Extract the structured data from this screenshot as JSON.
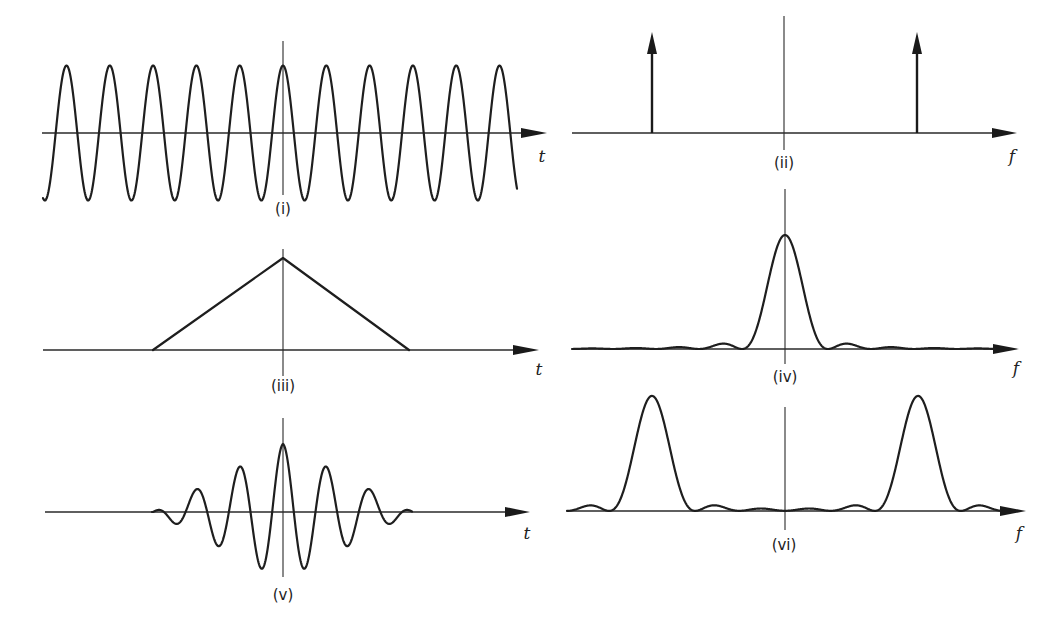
{
  "figure": {
    "panels": [
      {
        "id": "i",
        "label": "(i)",
        "axis_var": "t",
        "domain": "time",
        "description": "Continuous cosine wave"
      },
      {
        "id": "ii",
        "label": "(ii)",
        "axis_var": "f",
        "domain": "frequency",
        "description": "Pair of impulses at ±f0"
      },
      {
        "id": "iii",
        "label": "(iii)",
        "axis_var": "t",
        "domain": "time",
        "description": "Triangular window"
      },
      {
        "id": "iv",
        "label": "(iv)",
        "axis_var": "f",
        "domain": "frequency",
        "description": "sinc² spectrum of triangle"
      },
      {
        "id": "v",
        "label": "(v)",
        "axis_var": "t",
        "domain": "time",
        "description": "Cosine multiplied by triangular window"
      },
      {
        "id": "vi",
        "label": "(vi)",
        "axis_var": "f",
        "domain": "frequency",
        "description": "sinc² lobes shifted to ±f0"
      }
    ]
  },
  "chart_data": [
    {
      "type": "line",
      "panel": "(i)",
      "xlabel": "t",
      "function": "cos(2π f0 t)",
      "cycles_visible": 11,
      "amplitude": 1,
      "grid": false
    },
    {
      "type": "impulse",
      "panel": "(ii)",
      "xlabel": "f",
      "impulses": [
        {
          "x": -1,
          "label": "-f0"
        },
        {
          "x": 1,
          "label": "f0"
        }
      ],
      "grid": false
    },
    {
      "type": "line",
      "panel": "(iii)",
      "xlabel": "t",
      "function": "triangle",
      "x": [
        -1,
        0,
        1
      ],
      "values": [
        0,
        1,
        0
      ],
      "grid": false
    },
    {
      "type": "line",
      "panel": "(iv)",
      "xlabel": "f",
      "function": "sinc²",
      "center": 0,
      "sidelobes_visible": 4,
      "grid": false
    },
    {
      "type": "line",
      "panel": "(v)",
      "xlabel": "t",
      "function": "triangle(t)·cos(2π f0 t)",
      "peak_values": [
        0.34,
        0.67,
        1.0,
        0.67,
        0.34
      ],
      "grid": false
    },
    {
      "type": "line",
      "panel": "(vi)",
      "xlabel": "f",
      "function": "sinc²(f-f0) + sinc²(f+f0)",
      "lobe_centers": [
        -1,
        1
      ],
      "grid": false
    }
  ]
}
